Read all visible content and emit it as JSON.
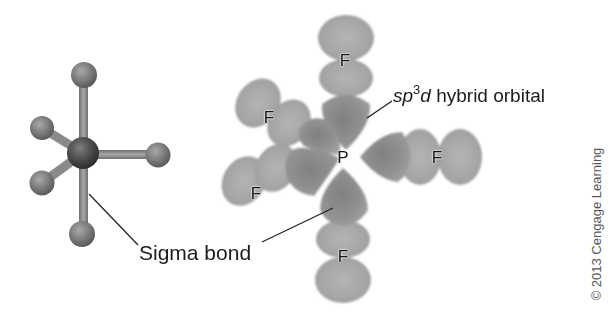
{
  "figure": {
    "ball_and_stick": {
      "central_atom": "P",
      "outer_atoms": [
        "F",
        "F",
        "F",
        "F",
        "F"
      ],
      "colors": {
        "central_atom": "#4a4a4a",
        "outer_atom": "#7a7a7a",
        "bond": "#8c8c8c"
      }
    },
    "orbital_model": {
      "central_label": "P",
      "fluorine_labels": [
        "F",
        "F",
        "F",
        "F",
        "F"
      ],
      "colors": {
        "hybrid_lobe": "#8f8f8f",
        "fluorine_lobe": "#a9a9a9"
      }
    },
    "annotations": {
      "sigma_bond": "Sigma bond",
      "hybrid_orbital_prefix": "sp",
      "hybrid_orbital_superscript": "3",
      "hybrid_orbital_d": "d",
      "hybrid_orbital_suffix": " hybrid orbital"
    },
    "copyright": "© 2013 Cengage Learning"
  }
}
